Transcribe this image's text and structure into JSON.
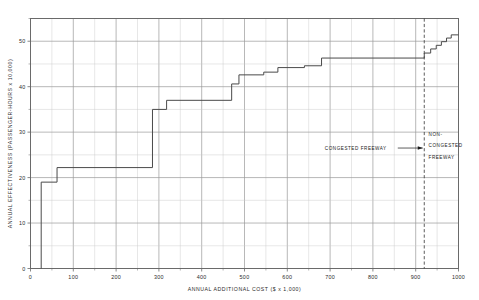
{
  "chart_data": {
    "type": "line",
    "subtype": "step-function cost-effectiveness curve",
    "title": "",
    "xlabel": "ANNUAL  ADDITIONAL  COST  ($ x 1,000)",
    "ylabel": "ANNUAL  EFFECTIVENESS  (PASSENGER-HOURS x 10,000)",
    "xlim": [
      0,
      1000
    ],
    "ylim": [
      0,
      55
    ],
    "x_ticks_major": [
      0,
      100,
      200,
      300,
      400,
      500,
      600,
      700,
      800,
      900,
      1000
    ],
    "x_tick_labels": [
      "0",
      "100",
      "200",
      "300",
      "400",
      "500",
      "600",
      "700",
      "800",
      "900",
      "1000"
    ],
    "x_minor_step": 50,
    "y_ticks_major": [
      0,
      10,
      20,
      30,
      40,
      50
    ],
    "y_tick_labels": [
      "0",
      "10",
      "20",
      "30",
      "40",
      "50"
    ],
    "y_minor_step": 5,
    "grid": true,
    "legend": "none",
    "series": [
      {
        "name": "cumulative effectiveness",
        "step": "post",
        "points": [
          {
            "x": 25,
            "y": 0
          },
          {
            "x": 25,
            "y": 19.0
          },
          {
            "x": 62,
            "y": 19.0
          },
          {
            "x": 62,
            "y": 22.2
          },
          {
            "x": 285,
            "y": 22.2
          },
          {
            "x": 285,
            "y": 35.0
          },
          {
            "x": 318,
            "y": 35.0
          },
          {
            "x": 318,
            "y": 37.0
          },
          {
            "x": 470,
            "y": 37.0
          },
          {
            "x": 470,
            "y": 40.6
          },
          {
            "x": 487,
            "y": 40.6
          },
          {
            "x": 487,
            "y": 42.6
          },
          {
            "x": 545,
            "y": 42.6
          },
          {
            "x": 545,
            "y": 43.2
          },
          {
            "x": 578,
            "y": 43.2
          },
          {
            "x": 578,
            "y": 44.2
          },
          {
            "x": 640,
            "y": 44.2
          },
          {
            "x": 640,
            "y": 44.6
          },
          {
            "x": 680,
            "y": 44.6
          },
          {
            "x": 680,
            "y": 46.3
          },
          {
            "x": 920,
            "y": 46.3
          },
          {
            "x": 920,
            "y": 47.4
          },
          {
            "x": 935,
            "y": 47.4
          },
          {
            "x": 935,
            "y": 48.3
          },
          {
            "x": 948,
            "y": 48.3
          },
          {
            "x": 948,
            "y": 49.1
          },
          {
            "x": 960,
            "y": 49.1
          },
          {
            "x": 960,
            "y": 49.9
          },
          {
            "x": 972,
            "y": 49.9
          },
          {
            "x": 972,
            "y": 50.7
          },
          {
            "x": 983,
            "y": 50.7
          },
          {
            "x": 983,
            "y": 51.4
          },
          {
            "x": 1000,
            "y": 51.4
          }
        ]
      }
    ],
    "reference_lines": [
      {
        "name": "congestion-boundary",
        "orientation": "vertical",
        "x": 920,
        "style": "dashed"
      }
    ],
    "annotations": [
      {
        "name": "congested-freeway",
        "text": "CONGESTED  FREEWAY",
        "x": 760,
        "y": 26.5,
        "arrow": "right-to-boundary"
      },
      {
        "name": "non-congested-freeway-line1",
        "text": "NON-",
        "x": 930,
        "y": 29.5
      },
      {
        "name": "non-congested-freeway-line2",
        "text": "CONGESTED",
        "x": 930,
        "y": 27.0
      },
      {
        "name": "non-congested-freeway-line3",
        "text": "FREEWAY",
        "x": 930,
        "y": 24.5
      }
    ],
    "colors": {
      "curve": "#4a4a4a",
      "grid_minor": "#c9c9c9",
      "grid_major": "#9a9a9a",
      "frame": "#6a6a6a",
      "text": "#1a1a1a",
      "background": "#ffffff"
    }
  }
}
